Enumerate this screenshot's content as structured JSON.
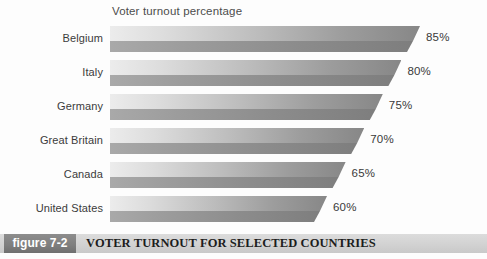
{
  "chart_data": {
    "type": "bar",
    "orientation": "horizontal",
    "title": "Voter turnout percentage",
    "xlabel": "",
    "ylabel": "",
    "xlim": [
      0,
      100
    ],
    "grid": false,
    "legend": null,
    "categories": [
      "Belgium",
      "Italy",
      "Germany",
      "Great Britain",
      "Canada",
      "United States"
    ],
    "values": [
      85,
      80,
      75,
      70,
      65,
      60
    ],
    "value_labels": [
      "85%",
      "80%",
      "75%",
      "70%",
      "65%",
      "60%"
    ],
    "bars": [
      {
        "label": "Belgium",
        "value": 85,
        "value_label": "85%"
      },
      {
        "label": "Italy",
        "value": 80,
        "value_label": "80%"
      },
      {
        "label": "Germany",
        "value": 75,
        "value_label": "75%"
      },
      {
        "label": "Great Britain",
        "value": 70,
        "value_label": "70%"
      },
      {
        "label": "Canada",
        "value": 65,
        "value_label": "65%"
      },
      {
        "label": "United States",
        "value": 60,
        "value_label": "60%"
      }
    ]
  },
  "caption": {
    "badge_label": "figure 7-2",
    "text": "VOTER TURNOUT FOR SELECTED COUNTRIES"
  },
  "colors": {
    "bar_light": "#ececec",
    "bar_mid": "#bcbcbc",
    "bar_dark": "#878787",
    "bar_shadow": "#8c8c8c",
    "badge_bg": "#7e7e7e",
    "caption_bg": "#d2d2d2",
    "text": "#3b3b3b",
    "page_bg": "#fdfdfd"
  }
}
